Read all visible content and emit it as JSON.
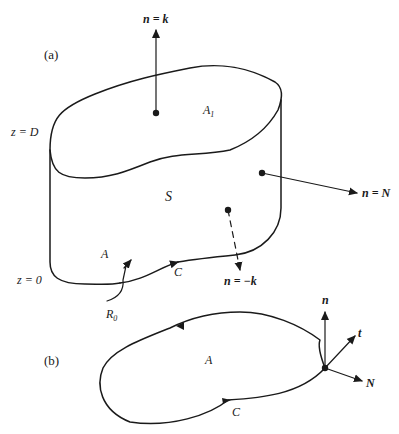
{
  "figure": {
    "panel_a": {
      "label": "(a)",
      "normal_top": {
        "label": "n = k"
      },
      "normal_side": {
        "label": "n = N"
      },
      "normal_bottom": {
        "label": "n = −k"
      },
      "top_area": {
        "label": "A",
        "subscript": "1"
      },
      "surface": {
        "label": "S"
      },
      "bottom_area": {
        "label": "A"
      },
      "curve": {
        "label": "C"
      },
      "region": {
        "label": "R",
        "subscript": "0"
      },
      "z_top": {
        "label": "z = D"
      },
      "z_bottom": {
        "label": "z = 0"
      }
    },
    "panel_b": {
      "label": "(b)",
      "area": {
        "label": "A"
      },
      "curve": {
        "label": "C"
      },
      "vector_n": {
        "label": "n"
      },
      "vector_t": {
        "label": "t"
      },
      "vector_N": {
        "label": "N"
      }
    },
    "colors": {
      "ink": "#1a1a1a",
      "background": "#ffffff"
    }
  }
}
